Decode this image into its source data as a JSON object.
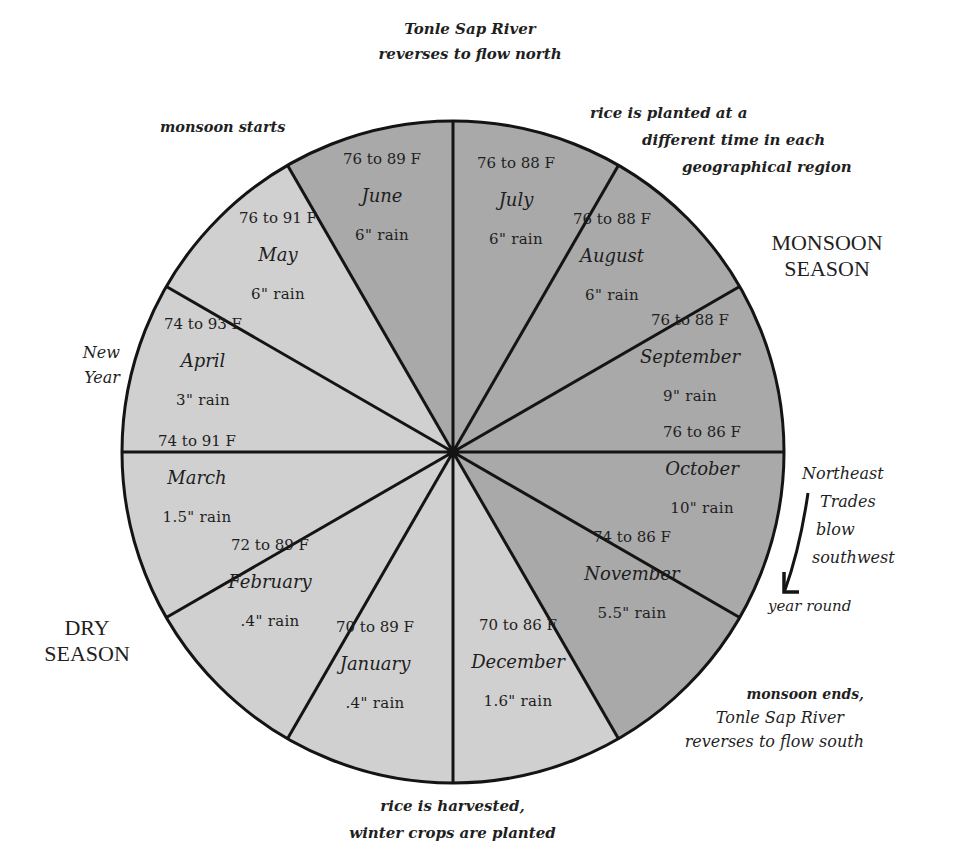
{
  "wheel": {
    "center": [
      453,
      452
    ],
    "radius": 331,
    "colors": {
      "monsoon_fill": "#a9a9a9",
      "dry_fill": "#d0d0d0",
      "stroke": "#141414"
    },
    "segments": [
      {
        "month": "July",
        "temp": "76 to 88 F",
        "rain": "6\" rain",
        "start_deg": 0,
        "season": "monsoon"
      },
      {
        "month": "August",
        "temp": "76 to 88 F",
        "rain": "6\" rain",
        "start_deg": 30,
        "season": "monsoon"
      },
      {
        "month": "September",
        "temp": "76 to 88 F",
        "rain": "9\" rain",
        "start_deg": 60,
        "season": "monsoon"
      },
      {
        "month": "October",
        "temp": "76 to 86 F",
        "rain": "10\" rain",
        "start_deg": 90,
        "season": "monsoon"
      },
      {
        "month": "November",
        "temp": "74 to 86 F",
        "rain": "5.5\" rain",
        "start_deg": 120,
        "season": "monsoon"
      },
      {
        "month": "December",
        "temp": "70 to 86 F",
        "rain": "1.6\" rain",
        "start_deg": 150,
        "season": "dry"
      },
      {
        "month": "January",
        "temp": "70 to 89 F",
        "rain": ".4\" rain",
        "start_deg": 180,
        "season": "dry"
      },
      {
        "month": "February",
        "temp": "72 to 89 F",
        "rain": ".4\" rain",
        "start_deg": 210,
        "season": "dry"
      },
      {
        "month": "March",
        "temp": "74 to 91 F",
        "rain": "1.5\" rain",
        "start_deg": 240,
        "season": "dry"
      },
      {
        "month": "April",
        "temp": "74 to 93 F",
        "rain": "3\" rain",
        "start_deg": 270,
        "season": "dry"
      },
      {
        "month": "May",
        "temp": "76 to 91 F",
        "rain": "6\" rain",
        "start_deg": 300,
        "season": "dry"
      },
      {
        "month": "June",
        "temp": "76 to 89 F",
        "rain": "6\" rain",
        "start_deg": 330,
        "season": "monsoon"
      }
    ]
  },
  "labels": {
    "top": [
      "Tonle Sap River",
      "reverses to flow north"
    ],
    "monsoon_starts": "monsoon starts",
    "rice_planted": [
      "rice is planted at a",
      "different time in each",
      "geographical region"
    ],
    "monsoon_season": [
      "MONSOON",
      "SEASON"
    ],
    "new_year": [
      "New",
      "Year"
    ],
    "northeast_trades": [
      "Northeast",
      "Trades",
      "blow",
      "southwest"
    ],
    "year_round": "year round",
    "monsoon_ends": [
      "monsoon ends,",
      "Tonle Sap River",
      "reverses to flow south"
    ],
    "rice_harvested": [
      "rice is harvested,",
      "winter crops are planted"
    ],
    "dry_season": [
      "DRY",
      "SEASON"
    ]
  },
  "text_positions": {
    "July": [
      516,
      206
    ],
    "August": [
      612,
      262
    ],
    "September": [
      690,
      363
    ],
    "October": [
      702,
      475
    ],
    "November": [
      632,
      580
    ],
    "December": [
      518,
      668
    ],
    "January": [
      375,
      670
    ],
    "February": [
      270,
      588
    ],
    "March": [
      197,
      484
    ],
    "April": [
      203,
      367
    ],
    "May": [
      278,
      261
    ],
    "June": [
      382,
      202
    ]
  }
}
